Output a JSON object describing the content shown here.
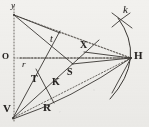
{
  "figure": {
    "kind": "geometric-optics-diagram",
    "background_color": "#f2f1ee",
    "ink_color": "#3a3733",
    "width": 149,
    "height": 127,
    "axes": {
      "y_axis_label": "y",
      "origin_label": "O",
      "y_axis_style": "dotted",
      "x_axis_style": "dotted"
    },
    "points": [
      {
        "id": "y",
        "label": "y",
        "x": 13,
        "y": 6,
        "style": "italic-lower",
        "size": 9
      },
      {
        "id": "O",
        "label": "O",
        "x": 3,
        "y": 57,
        "style": "serif-cap",
        "size": 9
      },
      {
        "id": "r",
        "label": "r",
        "x": 22,
        "y": 64,
        "style": "italic-lower",
        "size": 9
      },
      {
        "id": "l",
        "label": "t",
        "x": 50,
        "y": 38,
        "style": "italic-lower",
        "size": 9
      },
      {
        "id": "X",
        "label": "X",
        "x": 81,
        "y": 42,
        "style": "serif-cap",
        "size": 10
      },
      {
        "id": "k",
        "label": "k",
        "x": 124,
        "y": 7,
        "style": "italic-lower",
        "size": 10
      },
      {
        "id": "H",
        "label": "H",
        "x": 135,
        "y": 54,
        "style": "serif-cap",
        "size": 11
      },
      {
        "id": "S",
        "label": "S",
        "x": 68,
        "y": 70,
        "style": "serif-cap",
        "size": 10
      },
      {
        "id": "K",
        "label": "K",
        "x": 53,
        "y": 80,
        "style": "serif-cap",
        "size": 10
      },
      {
        "id": "T",
        "label": "T",
        "x": 32,
        "y": 78,
        "style": "serif-cap",
        "size": 10
      },
      {
        "id": "R",
        "label": "R",
        "x": 44,
        "y": 106,
        "style": "serif-cap",
        "size": 11
      },
      {
        "id": "V",
        "label": "V",
        "x": 4,
        "y": 107,
        "style": "serif-cap",
        "size": 11
      }
    ],
    "vertices": {
      "y": [
        14,
        15
      ],
      "O": [
        14,
        58
      ],
      "V": [
        13,
        118
      ],
      "H": [
        131,
        58
      ],
      "X": [
        88,
        49
      ],
      "S": [
        72,
        63
      ],
      "K": [
        60,
        77
      ],
      "T": [
        40,
        85
      ],
      "R": [
        58,
        98
      ],
      "l": [
        59,
        32
      ],
      "arc_top": [
        118,
        18
      ],
      "arc_bottom": [
        110,
        99
      ]
    },
    "segments": [
      {
        "name": "y-axis",
        "from": [
          14,
          6
        ],
        "to": [
          14,
          122
        ],
        "dash": "1,2"
      },
      {
        "name": "x-axis",
        "from": [
          14,
          58
        ],
        "to": [
          131,
          58
        ],
        "dash": "1,2"
      },
      {
        "name": "y-to-H",
        "from": [
          14,
          15
        ],
        "to": [
          131,
          58
        ],
        "dash": "1,2"
      },
      {
        "name": "y-to-l",
        "from": [
          14,
          15
        ],
        "to": [
          59,
          32
        ],
        "dash": "0"
      },
      {
        "name": "y-to-S",
        "from": [
          14,
          15
        ],
        "to": [
          72,
          63
        ],
        "dash": "0"
      },
      {
        "name": "l-to-H",
        "from": [
          59,
          32
        ],
        "to": [
          131,
          58
        ],
        "dash": "1,2"
      },
      {
        "name": "l-to-V",
        "from": [
          59,
          32
        ],
        "to": [
          13,
          118
        ],
        "dash": "0"
      },
      {
        "name": "V-to-H",
        "from": [
          13,
          118
        ],
        "to": [
          131,
          58
        ],
        "dash": "1,2"
      },
      {
        "name": "V-to-X",
        "from": [
          13,
          118
        ],
        "to": [
          96,
          42
        ],
        "dash": "0"
      },
      {
        "name": "X-to-H",
        "from": [
          88,
          49
        ],
        "to": [
          131,
          58
        ],
        "dash": "0"
      },
      {
        "name": "S-to-H",
        "from": [
          72,
          63
        ],
        "to": [
          131,
          58
        ],
        "dash": "0"
      },
      {
        "name": "K-curve-to-H",
        "from": [
          46,
          92
        ],
        "to": [
          131,
          58
        ],
        "dash": "0"
      },
      {
        "name": "T-R-crossline",
        "from": [
          35,
          70
        ],
        "to": [
          53,
          101
        ],
        "dash": "0"
      },
      {
        "name": "H-ray-down",
        "from": [
          131,
          58
        ],
        "to": [
          112,
          92
        ],
        "dash": "0"
      },
      {
        "name": "k-tick",
        "from": [
          112,
          12
        ],
        "to": [
          131,
          27
        ],
        "dash": "0"
      }
    ],
    "arcs": [
      {
        "name": "main-arc",
        "d": "M 118 18 Q 146 58 110 99"
      },
      {
        "name": "k-arc",
        "d": "M 113 26 Q 122 19 129 14"
      }
    ]
  }
}
